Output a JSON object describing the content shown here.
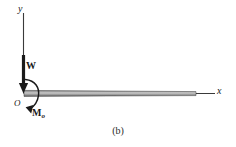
{
  "figure": {
    "caption": "(b)",
    "type": "free-body-diagram",
    "background_color": "#ffffff",
    "ink_color": "#1a1a1a"
  },
  "axes": {
    "y_label": "y",
    "x_label": "x",
    "origin_label": "O"
  },
  "loads": {
    "weight_label": "W",
    "moment_label": "M",
    "moment_subscript": "o"
  },
  "beam": {
    "fill_light": "#b9b9b9",
    "fill_dark": "#6e6e6e",
    "edge_color": "#3d3d3d"
  }
}
